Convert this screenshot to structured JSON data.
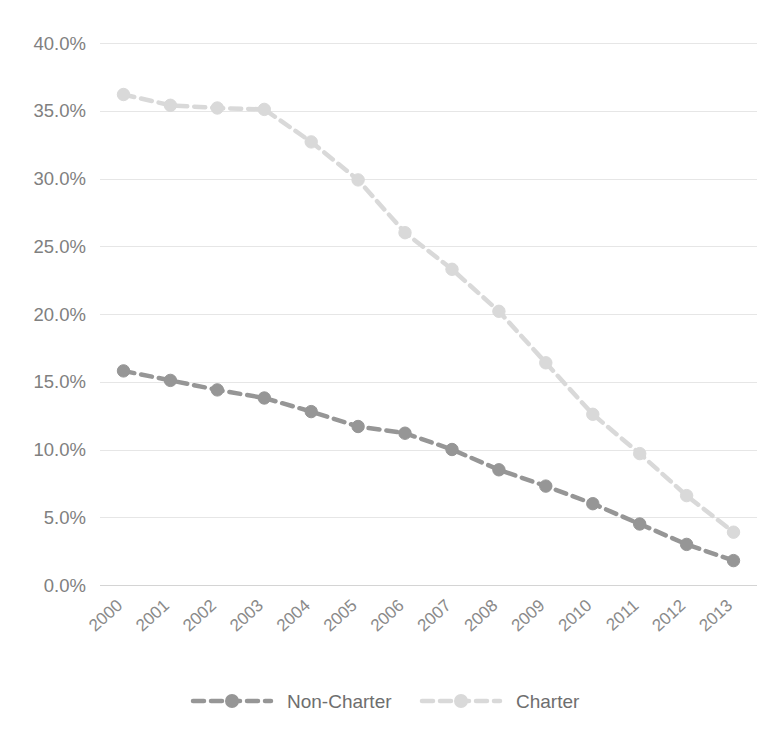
{
  "chart_data": {
    "type": "line",
    "title": "",
    "subtitle": "",
    "xlabel": "",
    "ylabel": "",
    "categories": [
      "2000",
      "2001",
      "2002",
      "2003",
      "2004",
      "2005",
      "2006",
      "2007",
      "2008",
      "2009",
      "2010",
      "2011",
      "2012",
      "2013"
    ],
    "x": [
      2000,
      2001,
      2002,
      2003,
      2004,
      2005,
      2006,
      2007,
      2008,
      2009,
      2010,
      2011,
      2012,
      2013
    ],
    "ylim": [
      0,
      40
    ],
    "ytick_values": [
      0,
      5,
      10,
      15,
      20,
      25,
      30,
      35,
      40
    ],
    "ytick_labels": [
      "0.0%",
      "5.0%",
      "10.0%",
      "15.0%",
      "20.0%",
      "25.0%",
      "30.0%",
      "35.0%",
      "40.0%"
    ],
    "grid": true,
    "grid_axis": "y",
    "legend_position": "bottom",
    "marker": "circle",
    "linestyle": "dashed",
    "series": [
      {
        "name": "Non-Charter",
        "color": "#969696",
        "values": [
          15.8,
          15.1,
          14.4,
          13.8,
          12.8,
          11.7,
          11.2,
          10.0,
          8.5,
          7.3,
          6.0,
          4.5,
          3.0,
          1.8
        ]
      },
      {
        "name": "Charter",
        "color": "#d9d9d9",
        "values": [
          36.2,
          35.4,
          35.2,
          35.1,
          32.7,
          29.9,
          26.0,
          23.3,
          20.2,
          16.4,
          12.6,
          9.7,
          6.6,
          3.9
        ]
      }
    ]
  },
  "legend": {
    "items": [
      {
        "label": "Non-Charter",
        "color": "#969696"
      },
      {
        "label": "Charter",
        "color": "#d9d9d9"
      }
    ]
  },
  "axes": {
    "y": {
      "labels": [
        "40.0%",
        "35.0%",
        "30.0%",
        "25.0%",
        "20.0%",
        "15.0%",
        "10.0%",
        "5.0%",
        "0.0%"
      ]
    },
    "x": {
      "labels": [
        "2000",
        "2001",
        "2002",
        "2003",
        "2004",
        "2005",
        "2006",
        "2007",
        "2008",
        "2009",
        "2010",
        "2011",
        "2012",
        "2013"
      ]
    }
  },
  "colors": {
    "gridline": "#e6e6e6",
    "axis_line": "#d4d4d4",
    "tick_text": "#808080",
    "legend_text": "#6e6e6e",
    "background": "#ffffff"
  }
}
